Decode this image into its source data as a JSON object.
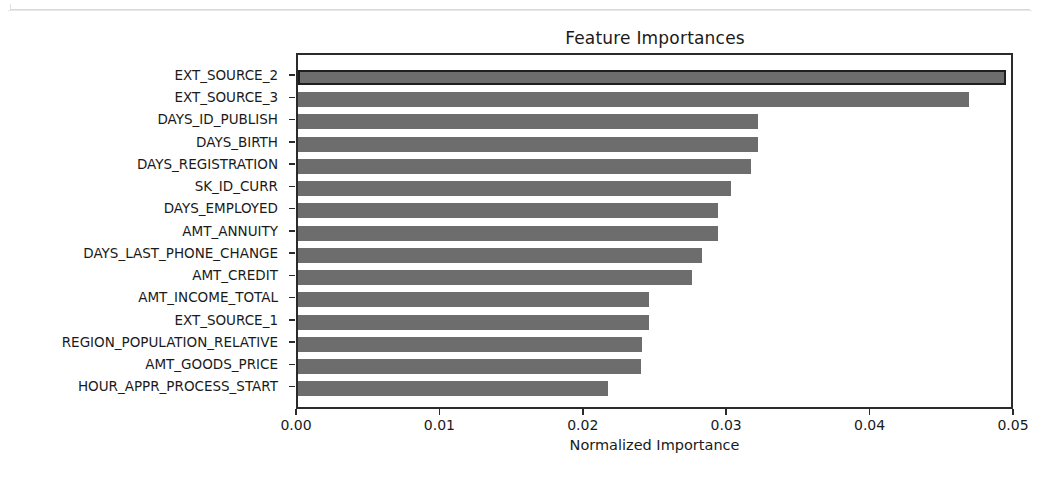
{
  "page": {
    "background_color": "#ffffff",
    "scan_artifact": true
  },
  "chart_data": {
    "type": "bar",
    "orientation": "horizontal",
    "title": "Feature Importances",
    "xlabel": "Normalized Importance",
    "ylabel": "",
    "xlim": [
      0.0,
      0.05
    ],
    "grid": false,
    "legend": null,
    "bar_color": "#6d6d6d",
    "edge_color": "#1f1f1f",
    "xticks": [
      0.0,
      0.01,
      0.02,
      0.03,
      0.04,
      0.05
    ],
    "xtick_labels": [
      "0.00",
      "0.01",
      "0.02",
      "0.03",
      "0.04",
      "0.05"
    ],
    "categories": [
      "EXT_SOURCE_2",
      "EXT_SOURCE_3",
      "DAYS_ID_PUBLISH",
      "DAYS_BIRTH",
      "DAYS_REGISTRATION",
      "SK_ID_CURR",
      "DAYS_EMPLOYED",
      "AMT_ANNUITY",
      "DAYS_LAST_PHONE_CHANGE",
      "AMT_CREDIT",
      "AMT_INCOME_TOTAL",
      "EXT_SOURCE_1",
      "REGION_POPULATION_RELATIVE",
      "AMT_GOODS_PRICE",
      "HOUR_APPR_PROCESS_START"
    ],
    "values": [
      0.0494,
      0.0468,
      0.0321,
      0.0321,
      0.0316,
      0.0302,
      0.0293,
      0.0293,
      0.0282,
      0.0275,
      0.0245,
      0.0245,
      0.024,
      0.0239,
      0.0216
    ]
  }
}
